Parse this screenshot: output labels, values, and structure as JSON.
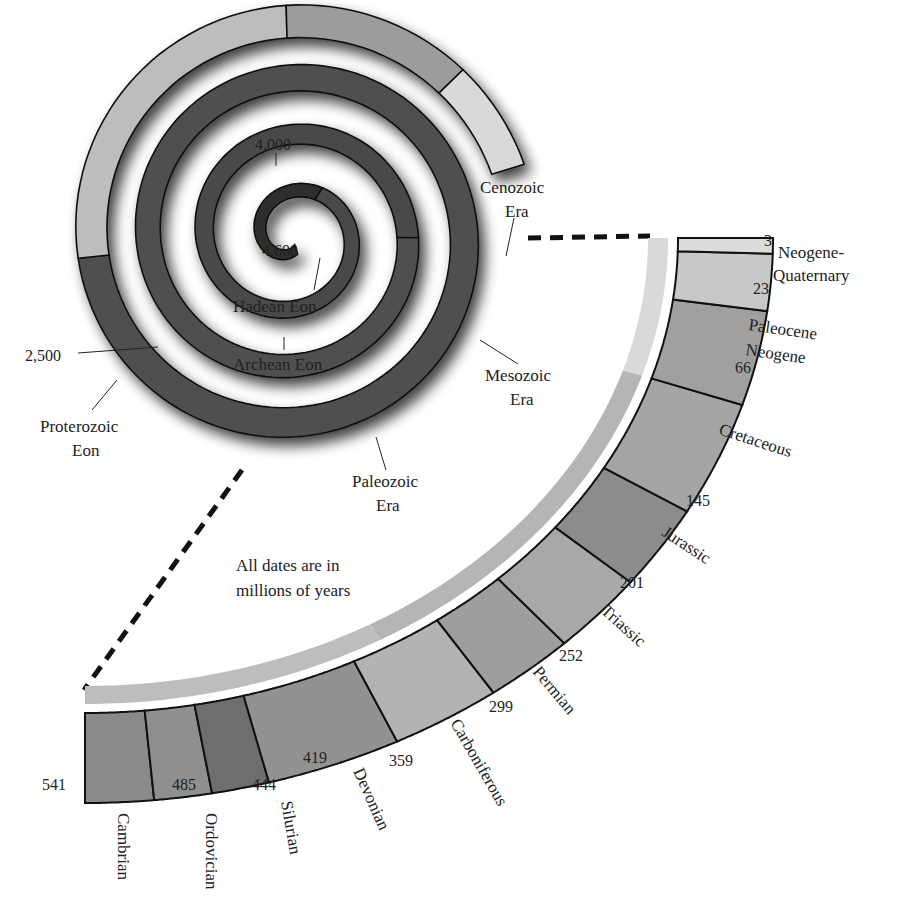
{
  "note": {
    "line1": "All dates are in",
    "line2": "millions of years"
  },
  "colors": {
    "eon_dark": "#2e2e2e",
    "eon_mid": "#4a4a4a",
    "proterozoic": "#505050",
    "paleozoic": "#bdbdbd",
    "mesozoic": "#9c9c9c",
    "cenozoic": "#d9d9d9",
    "outline": "#111111"
  },
  "spiral": {
    "labels": {
      "hadean_start": "4,600",
      "archean_start": "4,000",
      "proterozoic_start": "2,500",
      "hadean": "Hadean Eon",
      "archean": "Archean Eon",
      "proterozoic_1": "Proterozoic",
      "proterozoic_2": "Eon",
      "paleozoic_1": "Paleozoic",
      "paleozoic_2": "Era",
      "mesozoic_1": "Mesozoic",
      "mesozoic_2": "Era",
      "cenozoic_1": "Cenozoic",
      "cenozoic_2": "Era"
    }
  },
  "periods": [
    {
      "name": "Cambrian",
      "start": 541,
      "end": 485,
      "color": "#8a8a8a"
    },
    {
      "name": "Ordovician",
      "start": 485,
      "end": 444,
      "color": "#8f8f8f"
    },
    {
      "name": "Silurian",
      "start": 444,
      "end": 419,
      "color": "#6e6e6e"
    },
    {
      "name": "Devonian",
      "start": 419,
      "end": 359,
      "color": "#929292"
    },
    {
      "name": "Carboniferous",
      "start": 359,
      "end": 299,
      "color": "#b3b3b3"
    },
    {
      "name": "Permian",
      "start": 299,
      "end": 252,
      "color": "#9e9e9e"
    },
    {
      "name": "Triassic",
      "start": 252,
      "end": 201,
      "color": "#a8a8a8"
    },
    {
      "name": "Jurassic",
      "start": 201,
      "end": 145,
      "color": "#8c8c8c"
    },
    {
      "name": "Cretaceous",
      "start": 145,
      "end": 66,
      "color": "#a5a5a5"
    },
    {
      "name": "Paleocene Neogene",
      "start": 66,
      "end": 23,
      "color": "#a0a0a0"
    },
    {
      "name": "Neogene-Quaternary",
      "start": 23,
      "end": 3,
      "color": "#c8c8c8"
    },
    {
      "name": "",
      "start": 3,
      "end": 0,
      "color": "#dcdcdc"
    }
  ],
  "boundary_labels": [
    "541",
    "485",
    "444",
    "419",
    "359",
    "299",
    "252",
    "201",
    "145",
    "66",
    "23",
    "3"
  ],
  "period_labels": {
    "cambrian": "Cambrian",
    "ordovician": "Ordovician",
    "silurian": "Silurian",
    "devonian": "Devonian",
    "carboniferous": "Carboniferous",
    "permian": "Permian",
    "triassic": "Triassic",
    "jurassic": "Jurassic",
    "cretaceous": "Cretaceous",
    "paleocene_1": "Paleocene",
    "paleocene_2": "Neogene",
    "neoq_1": "Neogene-",
    "neoq_2": "Quaternary"
  }
}
